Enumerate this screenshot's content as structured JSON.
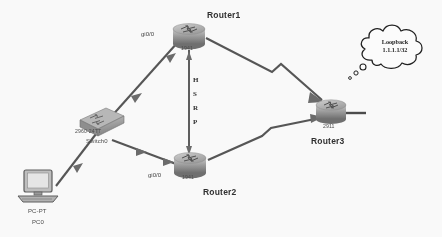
{
  "diagram": {
    "background": "#fdfdfd",
    "line_color": "#555555",
    "device_body": "#9a9a9a"
  },
  "devices": [
    {
      "id": "router1",
      "name": "Router1",
      "model": "1941",
      "type": "router",
      "x": 186,
      "y": 30
    },
    {
      "id": "router2",
      "name": "Router2",
      "model": "1941",
      "type": "router",
      "x": 188,
      "y": 165
    },
    {
      "id": "router3",
      "name": "Router3",
      "model": "2911",
      "type": "router",
      "x": 330,
      "y": 110
    },
    {
      "id": "switch0",
      "name": "Switch0",
      "model": "2960-24TT",
      "type": "switch",
      "x": 98,
      "y": 120
    },
    {
      "id": "pc0",
      "name": "PC0",
      "model": "PC-PT",
      "type": "pc",
      "x": 40,
      "y": 192
    }
  ],
  "interfaces": [
    {
      "id": "r1-gi00",
      "label": "gi0/0",
      "x": 141,
      "y": 31
    },
    {
      "id": "r2-gi00",
      "label": "gi0/0",
      "x": 148,
      "y": 172
    }
  ],
  "hsrp": {
    "letters": [
      "H",
      "S",
      "R",
      "P"
    ],
    "x": 192,
    "y_start": 76
  },
  "cloud": {
    "line1": "Loopback",
    "line2": "1.1.1.1/32",
    "x": 369,
    "y": 20,
    "w": 66,
    "h": 48
  },
  "links": [
    {
      "id": "link-sw-r1",
      "from": "switch0",
      "to": "router1",
      "kind": "ethernet"
    },
    {
      "id": "link-sw-r2",
      "from": "switch0",
      "to": "router2",
      "kind": "ethernet"
    },
    {
      "id": "link-sw-pc",
      "from": "switch0",
      "to": "pc0",
      "kind": "ethernet"
    },
    {
      "id": "link-r1-r2",
      "from": "router1",
      "to": "router2",
      "kind": "ethernet"
    },
    {
      "id": "link-r1-r3",
      "from": "router1",
      "to": "router3",
      "kind": "serial"
    },
    {
      "id": "link-r2-r3",
      "from": "router2",
      "to": "router3",
      "kind": "serial"
    },
    {
      "id": "link-r3-cloud",
      "from": "router3",
      "to": "cloud",
      "kind": "loopback"
    }
  ]
}
